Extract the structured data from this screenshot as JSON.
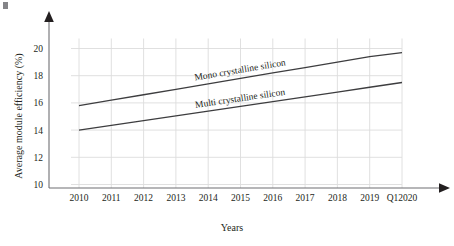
{
  "chart_data": {
    "type": "line",
    "title": "",
    "xlabel": "Years",
    "ylabel": "Average module efficiency (%)",
    "categories": [
      "2010",
      "2011",
      "2012",
      "2013",
      "2014",
      "2015",
      "2016",
      "2017",
      "2018",
      "2019",
      "Q12020"
    ],
    "ylim": [
      9,
      21
    ],
    "yticks": [
      10,
      12,
      14,
      16,
      18,
      20
    ],
    "ytick_labels": [
      "10",
      "12",
      "14",
      "16",
      "18",
      "20"
    ],
    "grid": true,
    "legend_position": "inline-along-lines",
    "series": [
      {
        "name": "Mono crystalline silicon",
        "color": "#3d3d3f",
        "values": [
          15.8,
          16.2,
          16.6,
          17.0,
          17.4,
          17.8,
          18.2,
          18.6,
          19.0,
          19.4,
          19.7
        ]
      },
      {
        "name": "Multi crystalline silicon",
        "color": "#3d3d3f",
        "values": [
          14.0,
          14.35,
          14.7,
          15.05,
          15.4,
          15.75,
          16.1,
          16.45,
          16.8,
          17.15,
          17.5
        ]
      }
    ],
    "axis_color": "#6f6f73",
    "grid_color": "#dcdcdc"
  }
}
